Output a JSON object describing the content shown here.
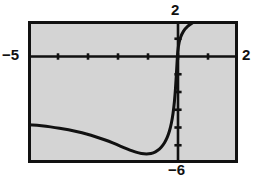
{
  "chart_data": {
    "type": "line",
    "title": "",
    "xlabel": "",
    "ylabel": "",
    "grid": false,
    "legend": null,
    "xlim": [
      -5,
      2
    ],
    "ylim": [
      -6,
      2
    ],
    "axis_labels": {
      "x_min": "−5",
      "x_max": "2",
      "y_max": "2",
      "y_min": "−6"
    },
    "x_tick_step": 1,
    "y_tick_step": 1,
    "x_ticks": [
      -4,
      -3,
      -2,
      -1,
      0,
      1
    ],
    "y_ticks": [
      -5,
      -4,
      -3,
      -2,
      -1,
      1
    ],
    "axes": {
      "x_axis_at_y": 0,
      "y_axis_at_x": 0
    },
    "features": {
      "vertical_asymptote_near": 0,
      "local_minimum": {
        "x": -1.05,
        "y": -5.5
      },
      "left_endpoint": {
        "x": -5,
        "y": -3.85
      },
      "exits_top_at_x": 0.6,
      "shape": "decreasing then steeply increasing through vertical asymptote region"
    },
    "series": [
      {
        "name": "curve",
        "color": "#111111",
        "points": [
          [
            -5.0,
            -3.85
          ],
          [
            -4.7,
            -3.88
          ],
          [
            -4.4,
            -3.93
          ],
          [
            -4.1,
            -4.0
          ],
          [
            -3.8,
            -4.08
          ],
          [
            -3.5,
            -4.18
          ],
          [
            -3.2,
            -4.3
          ],
          [
            -2.9,
            -4.44
          ],
          [
            -2.6,
            -4.6
          ],
          [
            -2.3,
            -4.78
          ],
          [
            -2.05,
            -4.96
          ],
          [
            -1.8,
            -5.13
          ],
          [
            -1.6,
            -5.27
          ],
          [
            -1.4,
            -5.39
          ],
          [
            -1.22,
            -5.47
          ],
          [
            -1.05,
            -5.5
          ],
          [
            -0.9,
            -5.47
          ],
          [
            -0.75,
            -5.38
          ],
          [
            -0.62,
            -5.22
          ],
          [
            -0.5,
            -5.0
          ],
          [
            -0.4,
            -4.72
          ],
          [
            -0.32,
            -4.4
          ],
          [
            -0.25,
            -4.0
          ],
          [
            -0.19,
            -3.5
          ],
          [
            -0.14,
            -2.9
          ],
          [
            -0.1,
            -2.2
          ],
          [
            -0.07,
            -1.45
          ],
          [
            -0.04,
            -0.6
          ],
          [
            -0.01,
            0.3
          ],
          [
            0.04,
            0.85
          ],
          [
            0.12,
            1.25
          ],
          [
            0.24,
            1.58
          ],
          [
            0.4,
            1.82
          ],
          [
            0.58,
            2.0
          ]
        ]
      }
    ]
  },
  "style": {
    "plot_background": "#d4d4d4",
    "frame_color": "#111111",
    "curve_color": "#111111",
    "page_background": "#ffffff"
  }
}
